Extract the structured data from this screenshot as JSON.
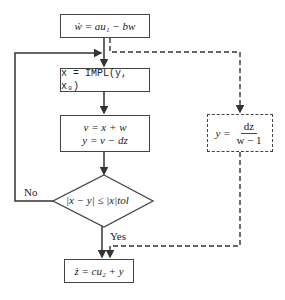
{
  "diagram": {
    "nodes": {
      "start": {
        "text": "ẇ = au₁ − bw"
      },
      "impl": {
        "text": "x = IMPL(y, x₀)"
      },
      "update": {
        "line1": "v = x + w",
        "line2": "y = v − dz"
      },
      "decision": {
        "text": "|x − y| ≤ |x|tol"
      },
      "init": {
        "lhs": "y =",
        "numerator": "dz",
        "denominator": "w − 1"
      },
      "end": {
        "text": "ż = cu₂ + y"
      }
    },
    "edge_labels": {
      "no": "No",
      "yes": "Yes"
    },
    "colors": {
      "stroke": "#444444",
      "background": "#ffffff"
    }
  }
}
